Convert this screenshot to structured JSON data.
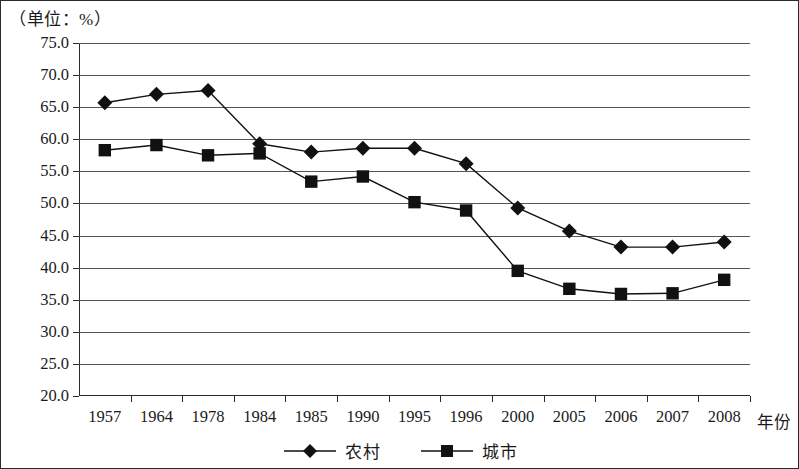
{
  "unit_note": "（单位：%）",
  "x_axis_title": "年份",
  "legend": [
    {
      "label": "农村",
      "marker": "diamond"
    },
    {
      "label": "城市",
      "marker": "square"
    }
  ],
  "chart_data": {
    "type": "line",
    "title": "",
    "subtitle": "",
    "xlabel": "年份",
    "ylabel": "",
    "unit": "（单位：%）",
    "categories": [
      "1957",
      "1964",
      "1978",
      "1984",
      "1985",
      "1990",
      "1995",
      "1996",
      "2000",
      "2005",
      "2006",
      "2007",
      "2008"
    ],
    "ylim": [
      20.0,
      75.0
    ],
    "ytick_step": 5.0,
    "yticks": [
      "75.0",
      "70.0",
      "65.0",
      "60.0",
      "55.0",
      "50.0",
      "45.0",
      "40.0",
      "35.0",
      "30.0",
      "25.0",
      "20.0"
    ],
    "grid": true,
    "legend_position": "bottom",
    "series": [
      {
        "name": "农村",
        "marker": "diamond",
        "color": "#111111",
        "values": [
          65.7,
          67.0,
          67.6,
          59.3,
          58.0,
          58.6,
          58.6,
          56.2,
          49.3,
          45.7,
          43.2,
          43.2,
          44.0
        ]
      },
      {
        "name": "城市",
        "marker": "square",
        "color": "#111111",
        "values": [
          58.3,
          59.1,
          57.5,
          57.8,
          53.4,
          54.2,
          50.2,
          48.9,
          39.5,
          36.7,
          35.9,
          36.0,
          38.1
        ]
      }
    ]
  }
}
